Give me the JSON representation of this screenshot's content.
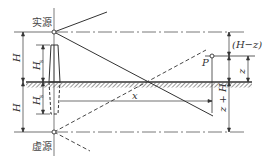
{
  "diagram": {
    "labels": {
      "real_source": "实源",
      "virtual_source": "虚源",
      "H_upper": "H",
      "H_lower": "H",
      "Hs_upper": "H",
      "Hs_upper_sub": "s",
      "Hs_lower": "H",
      "Hs_lower_sub": "s",
      "point": "P",
      "dist_x": "x",
      "H_minus_z": "(H−z)",
      "z": "z",
      "z_plus_H": "z + H"
    },
    "colors": {
      "line": "#3a3a3a",
      "hatch": "#555555",
      "background": "#ffffff"
    }
  }
}
